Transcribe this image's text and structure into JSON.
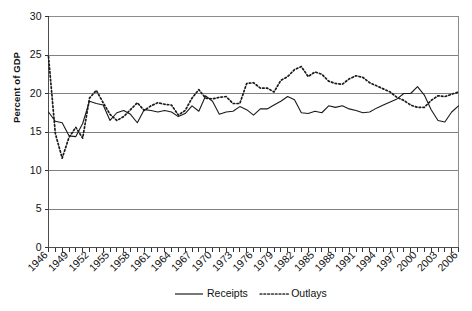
{
  "chart_data": {
    "type": "line",
    "title": "",
    "xlabel": "",
    "ylabel": "Percent of GDP",
    "ylim": [
      0,
      30
    ],
    "ytick_step": 5,
    "yticks": [
      0,
      5,
      10,
      15,
      20,
      25,
      30
    ],
    "grid": true,
    "legend_position": "bottom",
    "xlim": [
      1946,
      2006
    ],
    "xtick_step": 3,
    "x": [
      1946,
      1947,
      1948,
      1949,
      1950,
      1951,
      1952,
      1953,
      1954,
      1955,
      1956,
      1957,
      1958,
      1959,
      1960,
      1961,
      1962,
      1963,
      1964,
      1965,
      1966,
      1967,
      1968,
      1969,
      1970,
      1971,
      1972,
      1973,
      1974,
      1975,
      1976,
      1977,
      1978,
      1979,
      1980,
      1981,
      1982,
      1983,
      1984,
      1985,
      1986,
      1987,
      1988,
      1989,
      1990,
      1991,
      1992,
      1993,
      1994,
      1995,
      1996,
      1997,
      1998,
      1999,
      2000,
      2001,
      2002,
      2003,
      2004,
      2005,
      2006
    ],
    "xtick_labels": [
      "1946",
      "1949",
      "1952",
      "1955",
      "1958",
      "1961",
      "1964",
      "1967",
      "1970",
      "1973",
      "1976",
      "1979",
      "1982",
      "1985",
      "1988",
      "1991",
      "1994",
      "1997",
      "2000",
      "2003",
      "2006"
    ],
    "series": [
      {
        "name": "Receipts",
        "style": "solid",
        "values": [
          17.6,
          16.4,
          16.2,
          14.5,
          14.4,
          16.1,
          19.0,
          18.7,
          18.5,
          16.5,
          17.5,
          17.8,
          17.3,
          16.2,
          17.9,
          17.8,
          17.6,
          17.8,
          17.6,
          17.0,
          17.4,
          18.4,
          17.7,
          19.7,
          19.0,
          17.3,
          17.6,
          17.7,
          18.3,
          17.9,
          17.2,
          18.0,
          18.0,
          18.5,
          19.0,
          19.6,
          19.2,
          17.5,
          17.4,
          17.7,
          17.5,
          18.4,
          18.2,
          18.4,
          18.0,
          17.8,
          17.5,
          17.6,
          18.1,
          18.5,
          18.9,
          19.3,
          20.0,
          20.0,
          20.9,
          19.8,
          17.9,
          16.5,
          16.3,
          17.6,
          18.4
        ]
      },
      {
        "name": "Outlays",
        "style": "dotted",
        "values": [
          24.8,
          14.8,
          11.6,
          14.3,
          15.6,
          14.2,
          19.4,
          20.4,
          18.8,
          17.3,
          16.5,
          17.0,
          17.9,
          18.8,
          17.8,
          18.4,
          18.8,
          18.6,
          18.5,
          17.2,
          17.8,
          19.4,
          20.5,
          19.4,
          19.3,
          19.5,
          19.6,
          18.7,
          18.7,
          21.3,
          21.4,
          20.7,
          20.7,
          20.2,
          21.7,
          22.2,
          23.1,
          23.5,
          22.2,
          22.8,
          22.5,
          21.6,
          21.3,
          21.2,
          21.9,
          22.3,
          22.1,
          21.4,
          21.0,
          20.6,
          20.2,
          19.5,
          19.1,
          18.5,
          18.2,
          18.2,
          19.1,
          19.7,
          19.6,
          19.9,
          20.2
        ]
      }
    ]
  },
  "legend": {
    "items": [
      {
        "label": "Receipts",
        "style": "solid"
      },
      {
        "label": "Outlays",
        "style": "dotted"
      }
    ]
  },
  "axis": {
    "y_title": "Percent of GDP"
  }
}
